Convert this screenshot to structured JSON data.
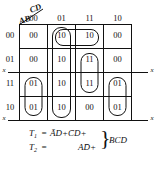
{
  "diagram": {
    "type": "karnaugh-map",
    "corner": {
      "top_label": "CD",
      "bottom_label": "AB"
    },
    "column_headers": [
      "00",
      "01",
      "11",
      "10"
    ],
    "row_headers": [
      "00",
      "01",
      "11",
      "10"
    ],
    "cells": [
      [
        "00",
        "10",
        "10",
        "00"
      ],
      [
        "00",
        "10",
        "11",
        "00"
      ],
      [
        "01",
        "10",
        "11",
        "01"
      ],
      [
        "01",
        "10",
        "00",
        "01"
      ]
    ],
    "axis_markers": {
      "left_upper": "x",
      "left_lower": "x",
      "right_upper": "x",
      "right_lower": "x"
    },
    "groupings": [
      {
        "name": "column-01-full",
        "cells": "col 01 rows 00,01,11,10"
      },
      {
        "name": "row-00-cols-01-11",
        "cells": "row 00 cols 01,11"
      },
      {
        "name": "col-11-rows-01-11",
        "cells": "col 11 rows 01,11"
      },
      {
        "name": "col-00-rows-11-10",
        "cells": "col 00 rows 11,10"
      },
      {
        "name": "col-10-rows-11-10",
        "cells": "col 10 rows 11,10"
      }
    ]
  },
  "equations": {
    "line1": {
      "lhs": "T",
      "lhs_sub": "1",
      "eq": "=",
      "terms": "ĀD+C̄D+"
    },
    "line2": {
      "lhs": "T",
      "lhs_sub": "2",
      "eq": "=",
      "terms": "AD̄+"
    },
    "brace": "}",
    "brace_label": "BCD"
  }
}
